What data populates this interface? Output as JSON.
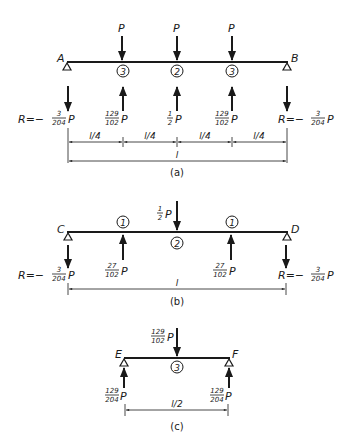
{
  "panels": {
    "a": {
      "caption": "(a)",
      "left_support": "A",
      "right_support": "B",
      "loads": [
        "P",
        "P",
        "P"
      ],
      "node_labels": [
        "3",
        "2",
        "3"
      ],
      "left_reaction": {
        "prefix": "R=−",
        "num": "3",
        "den": "204",
        "suffix": "P"
      },
      "right_reaction": {
        "prefix": "R=−",
        "num": "3",
        "den": "204",
        "suffix": "P"
      },
      "up_forces": [
        {
          "num": "129",
          "den": "102",
          "suffix": "P"
        },
        {
          "num": "1",
          "den": "2",
          "suffix": "P"
        },
        {
          "num": "129",
          "den": "102",
          "suffix": "P"
        }
      ],
      "dims": [
        "l/4",
        "l/4",
        "l/4",
        "l/4"
      ],
      "total_dim": "l"
    },
    "b": {
      "caption": "(b)",
      "left_support": "C",
      "right_support": "D",
      "center_load": {
        "num": "1",
        "den": "2",
        "suffix": "P"
      },
      "node_labels": [
        "1",
        "2",
        "1"
      ],
      "left_reaction": {
        "prefix": "R=−",
        "num": "3",
        "den": "204",
        "suffix": "P"
      },
      "right_reaction": {
        "prefix": "R=−",
        "num": "3",
        "den": "204",
        "suffix": "P"
      },
      "up_forces": [
        {
          "num": "27",
          "den": "102",
          "suffix": "P"
        },
        {
          "num": "27",
          "den": "102",
          "suffix": "P"
        }
      ],
      "total_dim": "l"
    },
    "c": {
      "caption": "(c)",
      "left_support": "E",
      "right_support": "F",
      "center_load": {
        "num": "129",
        "den": "102",
        "suffix": "P"
      },
      "node_label": "3",
      "left_reaction": {
        "num": "129",
        "den": "204",
        "suffix": "P"
      },
      "right_reaction": {
        "num": "129",
        "den": "204",
        "suffix": "P"
      },
      "total_dim": "l/2"
    }
  },
  "colors": {
    "ink": "#1a1a1a",
    "background": "#ffffff"
  }
}
